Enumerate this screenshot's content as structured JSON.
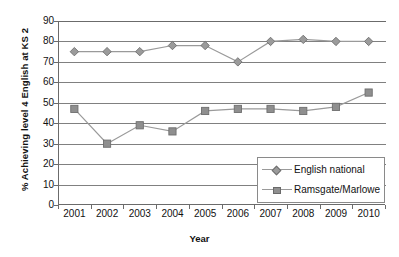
{
  "chart_data": {
    "type": "line",
    "title": "",
    "xlabel": "Year",
    "ylabel": "% Achieving level 4 English at KS 2",
    "categories": [
      "2001",
      "2002",
      "2003",
      "2004",
      "2005",
      "2006",
      "2007",
      "2008",
      "2009",
      "2010"
    ],
    "x": [
      2001,
      2002,
      2003,
      2004,
      2005,
      2006,
      2007,
      2008,
      2009,
      2010
    ],
    "ylim": [
      0,
      90
    ],
    "yticks": [
      0,
      10,
      20,
      30,
      40,
      50,
      60,
      70,
      80,
      90
    ],
    "grid": true,
    "legend_position": "inside-bottom-right",
    "series": [
      {
        "name": "English national",
        "marker": "diamond",
        "color": "#9b9b9b",
        "values": [
          75,
          75,
          75,
          78,
          78,
          70,
          80,
          81,
          80,
          80
        ]
      },
      {
        "name": "Ramsgate/Marlowe",
        "marker": "square",
        "color": "#8f8f8f",
        "values": [
          47,
          30,
          39,
          36,
          46,
          47,
          47,
          46,
          48,
          55
        ]
      }
    ]
  },
  "axes": {
    "ytick_labels": [
      "90",
      "80",
      "70",
      "60",
      "50",
      "40",
      "30",
      "20",
      "10",
      "0"
    ],
    "xtick_labels": [
      "2001",
      "2002",
      "2003",
      "2004",
      "2005",
      "2006",
      "2007",
      "2008",
      "2009",
      "2010"
    ],
    "x_title": "Year",
    "y_title": "% Achieving level 4 English at KS 2"
  },
  "legend": {
    "items": [
      {
        "label": "English national"
      },
      {
        "label": "Ramsgate/Marlowe"
      }
    ]
  },
  "colors": {
    "axis": "#6b6b6b",
    "grid": "#808080",
    "series1": "#9b9b9b",
    "series2": "#8f8f8f",
    "background": "#ffffff"
  }
}
